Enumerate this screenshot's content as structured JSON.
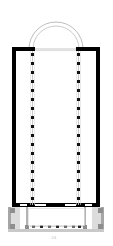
{
  "figure": {
    "kind": "architectural-floor-plan",
    "orientation": "apse at top, entrance at bottom",
    "caption": "24"
  },
  "palette": {
    "page_background": "#ffffff",
    "wall_solid": "#000000",
    "wall_secondary": "#9a9a9a",
    "wall_fill_light": "#d8d8d8",
    "apse_line": "#b0b0b0",
    "colonnade_line": "#bdbdbd",
    "column_marker": "#111111",
    "narthex_fill": "#ffffff",
    "pier_fill": "#8e8e8e"
  },
  "geometry": {
    "canvas": {
      "width": 113,
      "height": 246
    },
    "nave": {
      "label": "nave",
      "left": 12,
      "right": 100,
      "top": 47,
      "bottom": 207,
      "wall_thickness": 4
    },
    "apse": {
      "label": "apse",
      "center_x": 56,
      "base_y": 48,
      "outer_radius": 27,
      "inner_radius": 23,
      "stroke_width": 0.9
    },
    "apse_opening": {
      "x_start": 35,
      "x_end": 76
    },
    "colonnades": [
      {
        "name": "left-colonnade",
        "x": 32,
        "top": 52,
        "bottom": 204
      },
      {
        "name": "right-colonnade",
        "x": 78,
        "top": 52,
        "bottom": 204
      }
    ],
    "column_count_per_side": 17,
    "column_marker": {
      "width": 3.4,
      "height": 3.4
    },
    "nave_bottom_doors": [
      {
        "x_start": 34,
        "x_end": 46
      },
      {
        "x_start": 64,
        "x_end": 76
      },
      {
        "x_start": 84,
        "x_end": 92
      },
      {
        "x_start": 20,
        "x_end": 28
      }
    ],
    "narthex": {
      "label": "narthex",
      "left": 8,
      "right": 104,
      "top": 207,
      "bottom": 232,
      "wall_thickness": 3
    },
    "narthex_cross_walls": [
      {
        "x": 27
      },
      {
        "x": 85
      }
    ],
    "narthex_bottom_columns": {
      "y": 227,
      "x_start": 32,
      "x_end": 80,
      "count": 7
    },
    "narthex_corner_piers": [
      {
        "x": 9,
        "y": 208
      },
      {
        "x": 96,
        "y": 208
      },
      {
        "x": 9,
        "y": 224
      },
      {
        "x": 96,
        "y": 224
      }
    ]
  },
  "elements": {
    "apse_label": "apse",
    "nave_label": "nave",
    "aisle_left_label": "left aisle",
    "aisle_right_label": "right aisle",
    "narthex_label": "narthex",
    "colonnade_label": "colonnade"
  }
}
